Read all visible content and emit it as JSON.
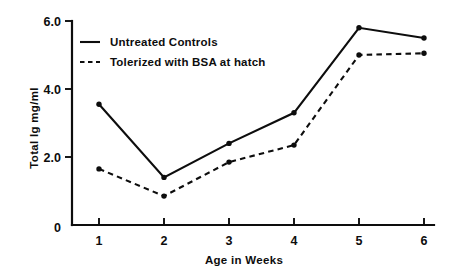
{
  "chart_data": {
    "type": "line",
    "title": "",
    "subtitle": "",
    "xlabel": "Age in Weeks",
    "ylabel": "Total Ig mg/ml",
    "x": [
      1,
      2,
      3,
      4,
      5,
      6
    ],
    "xticklabels": [
      "1",
      "2",
      "3",
      "4",
      "5",
      "6"
    ],
    "yticks": [
      0,
      2.0,
      4.0,
      6.0
    ],
    "yticklabels": [
      "0",
      "2.0",
      "4.0",
      "6.0"
    ],
    "xlim": [
      0.5,
      6.4
    ],
    "ylim": [
      0,
      6.0
    ],
    "grid": false,
    "legend_position": "upper-left-inside",
    "markers": "filled-circle",
    "axis_color": "#0d0d0d",
    "background_color": "#ffffff",
    "series": [
      {
        "name": "Untreated Controls",
        "style": "solid",
        "color": "#0d0d0d",
        "values": [
          3.55,
          1.4,
          2.4,
          3.3,
          5.8,
          5.5
        ]
      },
      {
        "name": "Tolerized with BSA at hatch",
        "style": "dashed",
        "color": "#0d0d0d",
        "values": [
          1.65,
          0.85,
          1.85,
          2.35,
          5.0,
          5.05
        ]
      }
    ],
    "legend": [
      {
        "label": "Untreated Controls",
        "style": "solid"
      },
      {
        "label": "Tolerized with BSA at hatch",
        "style": "dashed"
      }
    ]
  }
}
